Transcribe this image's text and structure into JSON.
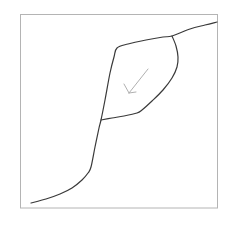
{
  "figure": {
    "type": "line-diagram",
    "title": "",
    "background_color": "#ffffff",
    "frame": {
      "name": "plot-frame",
      "x": 20.5,
      "y": 14.5,
      "width": 197,
      "height": 193.5,
      "stroke_color": "#b4b4b4",
      "stroke_width": 1,
      "fill": "none"
    },
    "curve": {
      "name": "hysteresis-curve",
      "stroke_color": "#3a3a3a",
      "stroke_width": 1.2,
      "fill": "none",
      "description": "S-shaped sigmoid curve with an open hysteresis loop in the middle"
    },
    "arrow": {
      "name": "direction-arrow",
      "stroke_color": "#b0b0b0",
      "stroke_width": 1,
      "x1": 148,
      "y1": 69,
      "x2": 129,
      "y2": 93,
      "head_left_x": 124,
      "head_left_y": 84,
      "head_right_x": 136,
      "head_right_y": 92,
      "direction": "down-left"
    }
  },
  "chart_data": {
    "type": "line",
    "title": "",
    "xlabel": "",
    "ylabel": "",
    "grid": false,
    "legend": null,
    "axis_ticks": [],
    "annotations": [
      {
        "name": "direction-arrow",
        "text": "",
        "kind": "arrow",
        "from": [
          148,
          69
        ],
        "to": [
          129,
          93
        ]
      }
    ],
    "series": [
      {
        "name": "lower-branch",
        "comment": "ascending outer path: flat tail, steep rise, upper plateau",
        "points": [
          [
            31,
            203
          ],
          [
            46,
            199
          ],
          [
            60,
            194
          ],
          [
            72,
            188
          ],
          [
            82,
            180
          ],
          [
            88,
            173
          ],
          [
            91,
            167
          ],
          [
            95,
            147
          ],
          [
            99,
            128
          ],
          [
            101,
            120
          ],
          [
            105,
            100
          ],
          [
            110,
            73
          ],
          [
            114,
            57
          ],
          [
            117,
            48
          ],
          [
            128,
            44
          ],
          [
            146,
            40
          ],
          [
            163,
            37
          ],
          [
            172,
            36
          ],
          [
            190,
            29
          ],
          [
            205,
            25
          ],
          [
            217,
            22
          ]
        ]
      },
      {
        "name": "loop-return-branch",
        "comment": "inner descending path closing the hysteresis loop",
        "points": [
          [
            172,
            36
          ],
          [
            176,
            46
          ],
          [
            178,
            57
          ],
          [
            177,
            67
          ],
          [
            172,
            78
          ],
          [
            163,
            90
          ],
          [
            152,
            101
          ],
          [
            142,
            110
          ],
          [
            137,
            113
          ],
          [
            124,
            116
          ],
          [
            112,
            118
          ],
          [
            101,
            120
          ]
        ]
      }
    ]
  }
}
